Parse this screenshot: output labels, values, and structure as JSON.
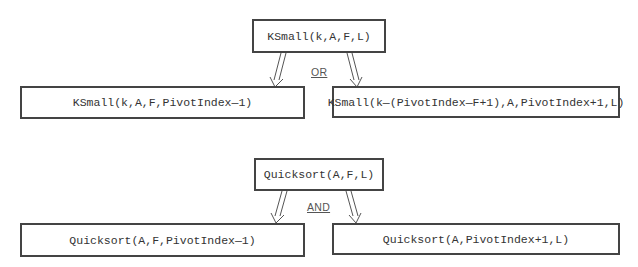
{
  "ksmall_tree": {
    "root": "KSmall(k,A,F,L)",
    "connector": "OR",
    "left_child": "KSmall(k,A,F,PivotIndex—1)",
    "right_child": "KSmall(k—(PivotIndex—F+1),A,PivotIndex+1,L)"
  },
  "quicksort_tree": {
    "root": "Quicksort(A,F,L)",
    "connector": "AND",
    "left_child": "Quicksort(A,F,PivotIndex—1)",
    "right_child": "Quicksort(A,PivotIndex+1,L)"
  },
  "colors": {
    "box_border": "#444444",
    "text": "#333333",
    "arrow": "#555555",
    "connector_label": "#555555"
  }
}
